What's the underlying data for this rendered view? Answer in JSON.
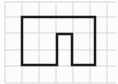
{
  "figure": {
    "canvas": {
      "width": 118,
      "height": 84,
      "background": "#fcfcfc"
    },
    "grid": {
      "line_color": "#d7d7d7",
      "line_width": 1,
      "x_min": 5,
      "x_max": 116,
      "y_min": 2,
      "y_max": 83,
      "vertical_lines_x": [
        5,
        22,
        39,
        56,
        73,
        90,
        107
      ],
      "horizontal_lines_y": [
        2,
        17,
        33,
        50,
        66,
        83
      ]
    },
    "shape": {
      "outline_color": "#1b1b1b",
      "outline_width": 2.5,
      "fill": "none",
      "vertices": [
        [
          22,
          17
        ],
        [
          95,
          17
        ],
        [
          95,
          65
        ],
        [
          72,
          65
        ],
        [
          72,
          34
        ],
        [
          57,
          34
        ],
        [
          57,
          65
        ],
        [
          22,
          65
        ]
      ]
    }
  }
}
